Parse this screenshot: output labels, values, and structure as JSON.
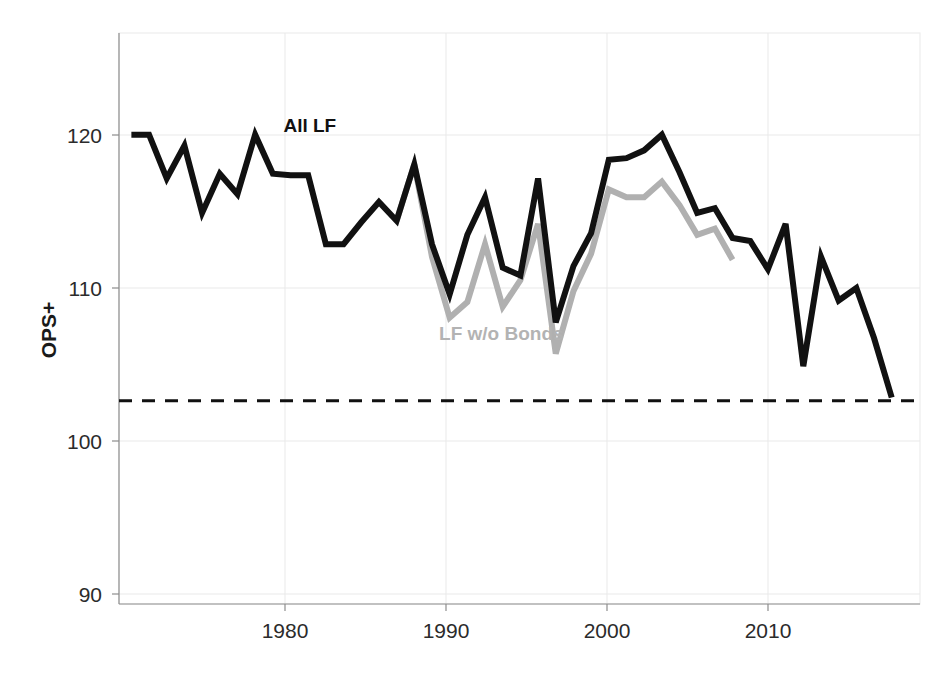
{
  "chart_data": {
    "type": "line",
    "title": "",
    "xlabel": "",
    "ylabel": "OPS+",
    "xlim": [
      1972.3,
      2017.6
    ],
    "ylim": [
      87.0,
      123.5
    ],
    "xticks": [
      1980,
      1990,
      2000,
      2010
    ],
    "yticks": [
      90,
      100,
      110,
      120
    ],
    "grid": true,
    "legend_position": "inline-annotations",
    "annotations": [
      {
        "text": "All LF",
        "x": 1981.6,
        "y": 117.2,
        "color": "#111111"
      },
      {
        "text": "LF w/o Bonds",
        "x": 1990.4,
        "y": 103.9,
        "color": "#b3b3b3"
      }
    ],
    "reference_lines": [
      {
        "y": 100,
        "style": "dashed",
        "color": "#111111"
      }
    ],
    "series": [
      {
        "name": "All LF",
        "color": "#111111",
        "x": [
          1973,
          1974,
          1975,
          1976,
          1977,
          1978,
          1979,
          1980,
          1981,
          1982,
          1983,
          1984,
          1985,
          1986,
          1987,
          1988,
          1989,
          1990,
          1991,
          1992,
          1993,
          1994,
          1995,
          1996,
          1997,
          1998,
          1999,
          2000,
          2001,
          2002,
          2003,
          2004,
          2005,
          2006,
          2007,
          2008,
          2009,
          2010,
          2011,
          2012,
          2013,
          2014,
          2015,
          2016
        ],
        "values": [
          117.0,
          117.0,
          114.2,
          116.3,
          112.0,
          114.5,
          113.2,
          117.0,
          114.5,
          114.4,
          114.4,
          110.0,
          110.0,
          111.4,
          112.7,
          111.5,
          115.1,
          110.0,
          106.8,
          110.6,
          113.0,
          108.5,
          108.0,
          114.2,
          105.0,
          108.6,
          110.7,
          115.4,
          115.5,
          116.0,
          117.0,
          114.6,
          112.0,
          112.3,
          110.4,
          110.2,
          108.4,
          111.3,
          102.2,
          109.2,
          106.4,
          107.2,
          104.0,
          100.2
        ]
      },
      {
        "name": "LF w/o Bonds",
        "color": "#b0b0b0",
        "x": [
          1988,
          1989,
          1990,
          1991,
          1992,
          1993,
          1994,
          1995,
          1996,
          1997,
          1998,
          1999,
          2000,
          2001,
          2002,
          2003,
          2004,
          2005,
          2006,
          2007
        ],
        "values": [
          111.5,
          115.1,
          109.2,
          105.3,
          106.3,
          110.0,
          106.0,
          107.7,
          111.3,
          103.0,
          107.0,
          109.4,
          113.5,
          113.0,
          113.0,
          114.0,
          112.5,
          110.6,
          111.0,
          109.0
        ]
      }
    ]
  },
  "axis": {
    "y_title": "OPS+",
    "y_tick_labels": [
      "120",
      "110",
      "100",
      "90"
    ],
    "x_tick_labels": [
      "1980",
      "1990",
      "2000",
      "2010"
    ]
  }
}
